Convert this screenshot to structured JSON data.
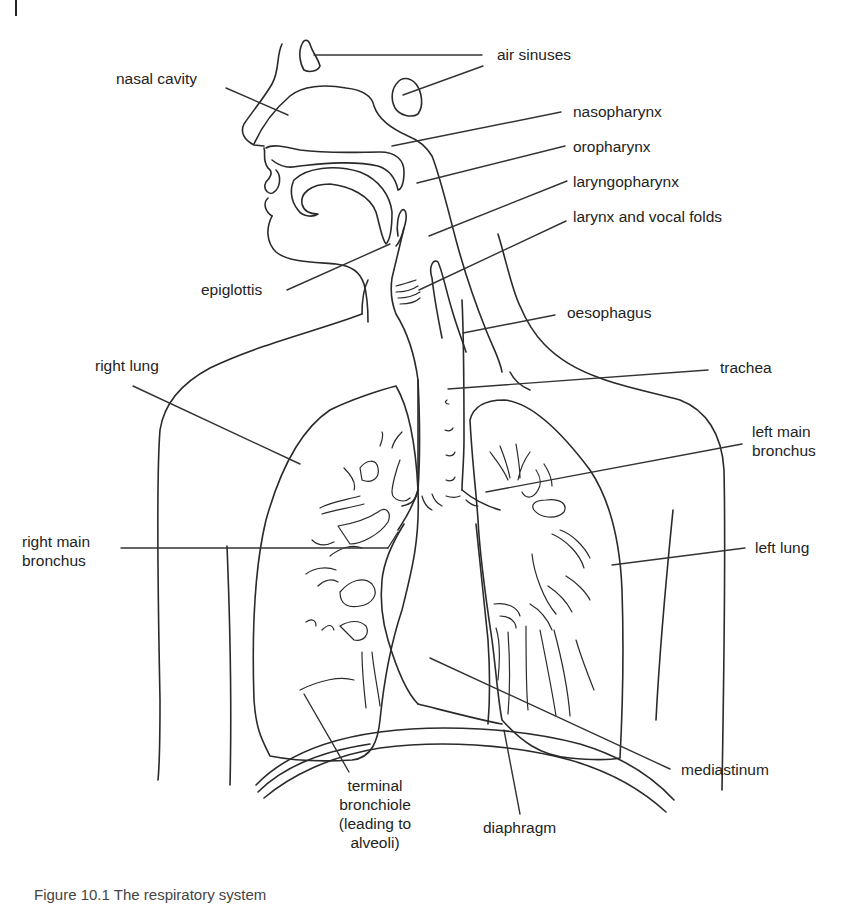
{
  "figure": {
    "caption": "Figure 10.1   The respiratory system",
    "labels": {
      "air_sinuses": "air sinuses",
      "nasal_cavity": "nasal cavity",
      "nasopharynx": "nasopharynx",
      "oropharynx": "oropharynx",
      "laryngopharynx": "laryngopharynx",
      "larynx_vocal_folds": "larynx and vocal folds",
      "epiglottis": "epiglottis",
      "oesophagus": "oesophagus",
      "right_lung": "right lung",
      "trachea": "trachea",
      "left_main_bronchus": "left main\nbronchus",
      "right_main_bronchus": "right main\nbronchus",
      "left_lung": "left lung",
      "terminal_bronchiole": "terminal\nbronchiole\n(leading to\nalveoli)",
      "mediastinum": "mediastinum",
      "diaphragm": "diaphragm"
    }
  }
}
